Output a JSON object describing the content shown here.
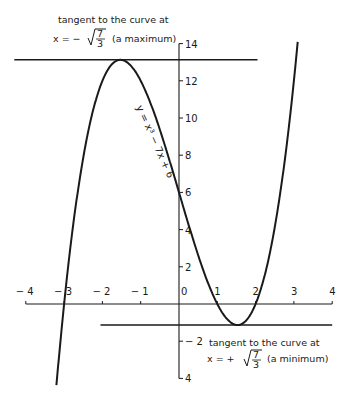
{
  "chart_data": {
    "type": "line",
    "title": "",
    "equation": "y = x³ − 7x + 6",
    "function": {
      "a3": 1,
      "a2": 0,
      "a1": -7,
      "a0": 6
    },
    "xlim": [
      -4,
      4
    ],
    "ylim": [
      -4,
      14
    ],
    "grid": false,
    "x_ticks": [
      -4,
      -3,
      -2,
      -1,
      0,
      1,
      2,
      3,
      4
    ],
    "x_tick_labels": [
      "− 4",
      "− 3",
      "− 2",
      "− 1",
      "0",
      "1",
      "2",
      "3",
      "4"
    ],
    "y_ticks": [
      14,
      12,
      10,
      8,
      6,
      4,
      2,
      -2,
      -4
    ],
    "y_tick_labels": [
      "14",
      "12",
      "10",
      "8",
      "6",
      "4",
      "2",
      "− 2",
      "4"
    ],
    "series": [
      {
        "name": "y = x³ − 7x + 6",
        "x_range": [
          -3.2,
          3.1
        ]
      }
    ],
    "tangents": [
      {
        "name": "maximum tangent",
        "x": -1.528,
        "y": 13.13,
        "x_from": -4,
        "x_to": 2.0
      },
      {
        "name": "minimum tangent",
        "x": 1.528,
        "y": -1.13,
        "x_from": -2,
        "x_to": 4
      }
    ],
    "roots": [
      -3,
      1,
      2
    ],
    "y_intercept": 6
  },
  "labels": {
    "curve": "y = x³ − 7x + 6",
    "max_line1": "tangent to the curve at",
    "max_line2_prefix": "x = −",
    "max_line2_suffix": "(a maximum)",
    "min_line1": "tangent to the curve at",
    "min_line2_prefix": "x = +",
    "min_line2_suffix": "(a minimum)",
    "frac_num": "7",
    "frac_den": "3"
  }
}
